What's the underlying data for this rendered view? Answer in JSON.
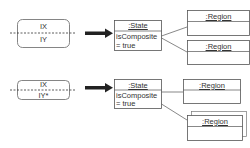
{
  "diagram": {
    "rows": [
      {
        "notation": {
          "top_label": "IX",
          "bottom_label": "IY"
        },
        "state": {
          "name": ":State",
          "attr_line1": "isComposite",
          "attr_line2": "= true"
        },
        "regions": [
          {
            "name": ":Region",
            "multiple": false
          },
          {
            "name": ":Region",
            "multiple": false
          }
        ]
      },
      {
        "notation": {
          "top_label": "IX",
          "bottom_label": "IY*"
        },
        "state": {
          "name": ":State",
          "attr_line1": "isComposite",
          "attr_line2": "= true"
        },
        "regions": [
          {
            "name": ":Region",
            "multiple": false
          },
          {
            "name": ":Region",
            "multiple": true
          }
        ]
      }
    ],
    "colors": {
      "stroke": "#555555",
      "arrow": "#222222",
      "text": "#333333"
    }
  }
}
